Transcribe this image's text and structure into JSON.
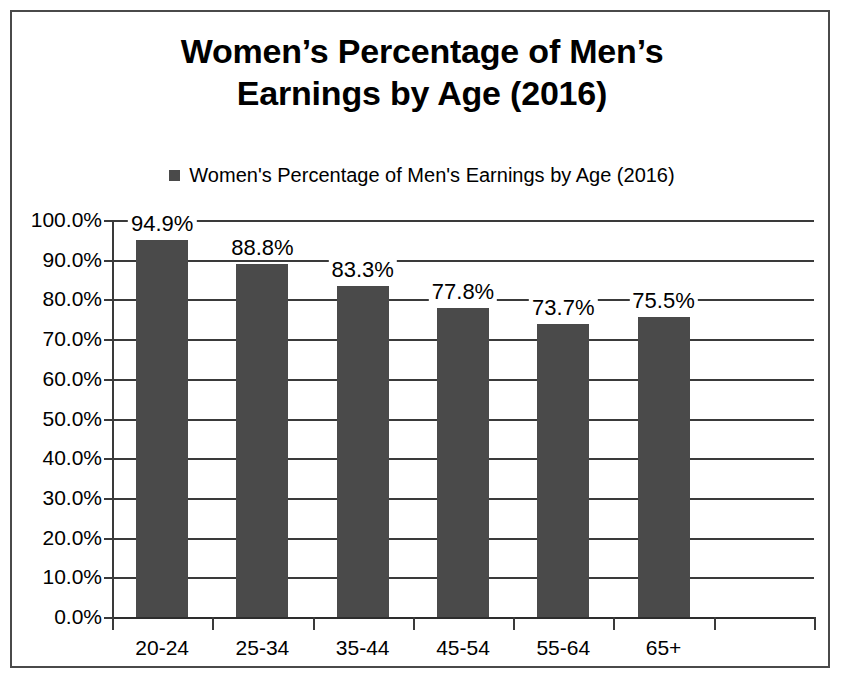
{
  "chart_data": {
    "type": "bar",
    "title": "Women’s Percentage of Men’s Earnings by Age (2016)",
    "title_line1": "Women’s Percentage of Men’s",
    "title_line2": "Earnings by Age (2016)",
    "legend": {
      "position": "top-center",
      "entries": [
        {
          "label": "Women's Percentage of Men's Earnings by Age (2016)",
          "color": "#4a4a4a"
        }
      ]
    },
    "categories": [
      "20-24",
      "25-34",
      "35-44",
      "45-54",
      "55-64",
      "65+"
    ],
    "values": [
      94.9,
      88.8,
      83.3,
      77.8,
      73.7,
      75.5
    ],
    "data_labels": [
      "94.9%",
      "88.8%",
      "83.3%",
      "77.8%",
      "73.7%",
      "75.5%"
    ],
    "series": [
      {
        "name": "Women's Percentage of Men's Earnings by Age (2016)",
        "values": [
          94.9,
          88.8,
          83.3,
          77.8,
          73.7,
          75.5
        ],
        "color": "#4a4a4a"
      }
    ],
    "xlabel": "",
    "ylabel": "",
    "ylim": [
      0,
      100
    ],
    "ytick_values": [
      0,
      10,
      20,
      30,
      40,
      50,
      60,
      70,
      80,
      90,
      100
    ],
    "ytick_labels": [
      "0.0%",
      "10.0%",
      "20.0%",
      "30.0%",
      "40.0%",
      "50.0%",
      "60.0%",
      "70.0%",
      "80.0%",
      "90.0%",
      "100.0%"
    ],
    "grid": true,
    "grid_axis": "y",
    "empty_trailing_slot": true,
    "colors": {
      "bar": "#4a4a4a",
      "grid": "#3a3a3a",
      "axis": "#3a3a3a",
      "text": "#000000",
      "background": "#ffffff",
      "frame_border": "#4a4a4a"
    }
  }
}
